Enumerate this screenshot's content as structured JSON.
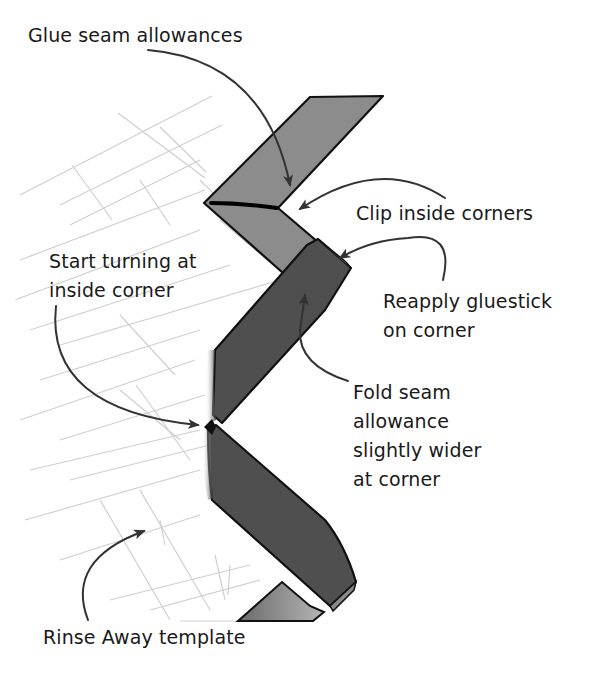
{
  "diagram": {
    "colors": {
      "background": "#ffffff",
      "light_strip": "#8c8c8c",
      "dark_strip": "#4f4f4f",
      "outline": "#111111",
      "grid_lines": "#cfcfcf",
      "arrow": "#333333",
      "text": "#1a1a1a"
    },
    "labels": {
      "glue_seam": "Glue seam allowances",
      "clip_corners": "Clip inside corners",
      "start_turning": "Start turning at\ninside corner",
      "reapply_gluestick": "Reapply gluestick\non corner",
      "fold_seam": "Fold seam\nallowance\nslightly wider\nat corner",
      "rinse_away": "Rinse Away template"
    },
    "callouts": [
      {
        "label": "Glue seam allowances",
        "points_to": "upper light strip"
      },
      {
        "label": "Clip inside corners",
        "points_to": "clip line at upper inside corner"
      },
      {
        "label": "Start turning at inside corner",
        "points_to": "middle inside corner point"
      },
      {
        "label": "Reapply gluestick on corner",
        "points_to": "top edge of dark folded strip"
      },
      {
        "label": "Fold seam allowance slightly wider at corner",
        "points_to": "dark folded strip"
      },
      {
        "label": "Rinse Away template",
        "points_to": "grid template area"
      }
    ]
  }
}
